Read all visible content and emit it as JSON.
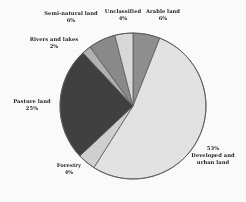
{
  "chart_data": {
    "type": "pie",
    "title": "",
    "subtitle": "",
    "xlabel": "",
    "ylabel": "",
    "legend_position": "outside-labels",
    "grid": false,
    "categories": [
      "Arable land",
      "Developed and urban land",
      "Forestry",
      "Pasture land",
      "Rivers and lakes",
      "Semi-natural land",
      "Unclassified"
    ],
    "values": [
      6,
      53,
      4,
      25,
      2,
      6,
      4
    ],
    "value_unit": "%",
    "total": 100,
    "slices": [
      {
        "label": "Arable land",
        "percent_text": "6%",
        "value": 6,
        "color": "#8f8f8f",
        "start_angle_deg": 0,
        "end_angle_deg": 21.6
      },
      {
        "label": "Developed and urban land",
        "label_line1": "Developed and",
        "label_line2": "urban land",
        "percent_text": "53%",
        "value": 53,
        "color": "#e6e6e6",
        "start_angle_deg": 21.6,
        "end_angle_deg": 212.4
      },
      {
        "label": "Forestry",
        "percent_text": "4%",
        "value": 4,
        "color": "#d2d2d2",
        "start_angle_deg": 212.4,
        "end_angle_deg": 226.8
      },
      {
        "label": "Pasture land",
        "percent_text": "25%",
        "value": 25,
        "color": "#3e3e3e",
        "start_angle_deg": 226.8,
        "end_angle_deg": 316.8
      },
      {
        "label": "Rivers and lakes",
        "percent_text": "2%",
        "value": 2,
        "color": "#b4b4b4",
        "start_angle_deg": 316.8,
        "end_angle_deg": 324.0
      },
      {
        "label": "Semi-natural land",
        "percent_text": "6%",
        "value": 6,
        "color": "#8a8a8a",
        "start_angle_deg": 324.0,
        "end_angle_deg": 345.6
      },
      {
        "label": "Unclassified",
        "percent_text": "4%",
        "value": 4,
        "color": "#dcdcdc",
        "start_angle_deg": 345.6,
        "end_angle_deg": 360
      }
    ],
    "geometry": {
      "center_x": 133,
      "center_y": 106,
      "radius": 73
    },
    "style": {
      "background": "#ffffff",
      "outline": "#5a5a5a",
      "text_color": "#1c1c1c"
    }
  }
}
